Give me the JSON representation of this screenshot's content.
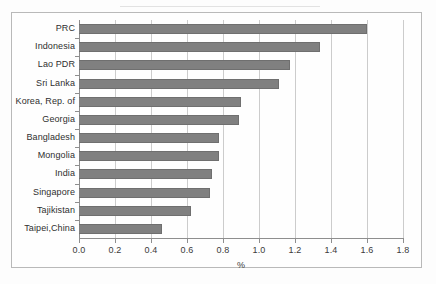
{
  "chart_data": {
    "type": "bar",
    "orientation": "horizontal",
    "title": "",
    "xlabel": "%",
    "ylabel": "",
    "xlim": [
      0.0,
      1.8
    ],
    "xticks": [
      "0.0",
      "0.2",
      "0.4",
      "0.6",
      "0.8",
      "1.0",
      "1.2",
      "1.4",
      "1.6",
      "1.8"
    ],
    "grid": true,
    "legend": "none",
    "bar_color": "#808080",
    "categories": [
      "PRC",
      "Indonesia",
      "Lao PDR",
      "Sri Lanka",
      "Korea, Rep. of",
      "Georgia",
      "Bangladesh",
      "Mongolia",
      "India",
      "Singapore",
      "Tajikistan",
      "Taipei,China"
    ],
    "values": [
      1.6,
      1.34,
      1.17,
      1.11,
      0.9,
      0.89,
      0.78,
      0.78,
      0.74,
      0.73,
      0.62,
      0.46
    ]
  }
}
